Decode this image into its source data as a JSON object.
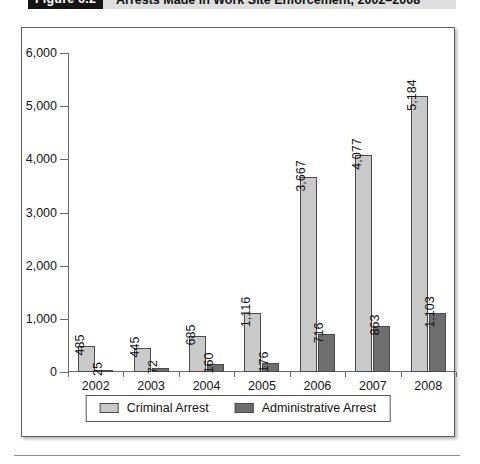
{
  "figure": {
    "number_label": "Figure 6.2",
    "caption": "Arrests Made in Work Site Enforcement, 2002–2008"
  },
  "legend": {
    "position": "bottom-center",
    "entries": [
      {
        "label": "Criminal Arrest",
        "color": "#c9c9c9",
        "swatch_name": "legend-swatch-criminal"
      },
      {
        "label": "Administrative Arrest",
        "color": "#6e6e6e",
        "swatch_name": "legend-swatch-administrative"
      }
    ]
  },
  "axes": {
    "y_tick_labels": [
      "0",
      "1,000",
      "2,000",
      "3,000",
      "4,000",
      "5,000",
      "6,000"
    ],
    "x_tick_labels": [
      "2002",
      "2003",
      "2004",
      "2005",
      "2006",
      "2007",
      "2008"
    ]
  },
  "chart_data": {
    "type": "bar",
    "title": "Arrests Made in Work Site Enforcement, 2002–2008",
    "subtitle": "",
    "xlabel": "",
    "ylabel": "",
    "categories": [
      "2002",
      "2003",
      "2004",
      "2005",
      "2006",
      "2007",
      "2008"
    ],
    "series": [
      {
        "name": "Criminal Arrest",
        "color": "#c9c9c9",
        "values": [
          485,
          445,
          685,
          1116,
          3667,
          4077,
          5184
        ],
        "value_labels": [
          "485",
          "445",
          "685",
          "1,116",
          "3,667",
          "4,077",
          "5,184"
        ]
      },
      {
        "name": "Administrative Arrest",
        "color": "#6e6e6e",
        "values": [
          25,
          72,
          160,
          176,
          716,
          863,
          1103
        ],
        "value_labels": [
          "25",
          "72",
          "160",
          "176",
          "716",
          "863",
          "1,103"
        ]
      }
    ],
    "ylim": [
      0,
      6000
    ],
    "ytick_step": 1000,
    "ytick_labels": [
      "0",
      "1,000",
      "2,000",
      "3,000",
      "4,000",
      "5,000",
      "6,000"
    ],
    "grid": false,
    "legend_position": "bottom-center",
    "data_labels": true,
    "data_label_rotation": -90
  }
}
